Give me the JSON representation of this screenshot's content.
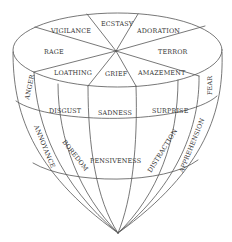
{
  "diagram": {
    "colors": {
      "line": "#555555",
      "text": "#333333",
      "background": "#ffffff"
    },
    "top_face": {
      "sectors": [
        "ECSTASY",
        "ADORATION",
        "TERROR",
        "AMAZEMENT",
        "GRIEF",
        "LOATHING",
        "RAGE",
        "VIGILANCE"
      ]
    },
    "ring_1": {
      "side_left": "ANGER",
      "front": [
        "DISGUST",
        "SADNESS",
        "SURPRISE"
      ],
      "side_right": "FEAR"
    },
    "ring_2": {
      "side_left": "ANNOYANCE",
      "front_left": "BOREDOM",
      "front_center": "PENSIVENESS",
      "front_right": "DISTRACTION",
      "side_right": "APPREHENSION"
    }
  }
}
